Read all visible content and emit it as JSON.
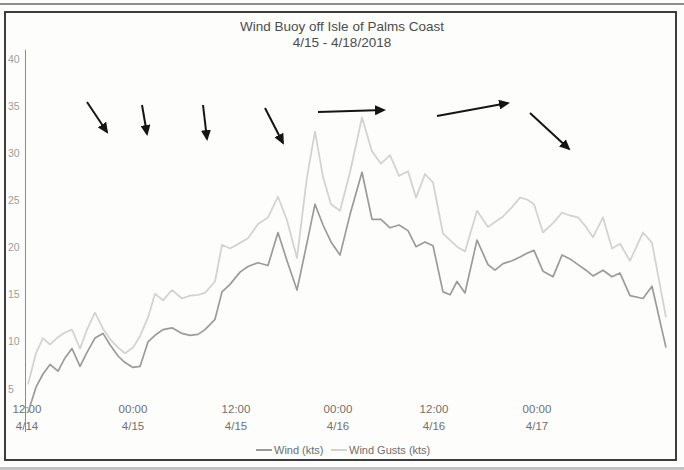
{
  "window": {
    "title_line1": "Wind Buoy off Isle of Palms Coast",
    "title_line2": "4/15 - 4/18/2018"
  },
  "chart_data": {
    "type": "line",
    "title": "Wind Buoy off Isle of Palms Coast",
    "subtitle": "4/15 - 4/18/2018",
    "xlabel": "",
    "ylabel": "",
    "ylim": [
      0,
      40
    ],
    "grid": false,
    "legend_position": "bottom",
    "yticks": [
      40,
      35,
      30,
      25,
      20,
      15,
      10,
      5
    ],
    "x_axis_ticks": [
      {
        "time": "12:00",
        "date": "4/14",
        "x_px": 27
      },
      {
        "time": "00:00",
        "date": "4/15",
        "x_px": 133
      },
      {
        "time": "12:00",
        "date": "4/15",
        "x_px": 236
      },
      {
        "time": "00:00",
        "date": "4/16",
        "x_px": 338
      },
      {
        "time": "12:00",
        "date": "4/16",
        "x_px": 434
      },
      {
        "time": "00:00",
        "date": "4/17",
        "x_px": 537
      }
    ],
    "series": [
      {
        "name": "Wind (kts)",
        "color": "#9b9b9b",
        "x_px": [
          28,
          36,
          43,
          50,
          58,
          65,
          72,
          80,
          87,
          95,
          103,
          110,
          118,
          125,
          133,
          140,
          148,
          155,
          163,
          172,
          182,
          190,
          198,
          205,
          215,
          222,
          230,
          240,
          248,
          258,
          268,
          278,
          287,
          297,
          307,
          315,
          323,
          331,
          340,
          350,
          362,
          372,
          381,
          390,
          399,
          408,
          416,
          425,
          433,
          443,
          450,
          457,
          465,
          477,
          488,
          495,
          503,
          512,
          520,
          527,
          534,
          543,
          553,
          562,
          570,
          578,
          586,
          593,
          603,
          612,
          620,
          630,
          643,
          652,
          666
        ],
        "values": [
          2.5,
          5.2,
          6.6,
          7.6,
          6.9,
          8.3,
          9.3,
          7.4,
          8.9,
          10.4,
          10.9,
          9.7,
          8.5,
          7.8,
          7.3,
          7.4,
          10.0,
          10.7,
          11.3,
          11.5,
          10.9,
          10.7,
          10.8,
          11.3,
          12.4,
          15.3,
          16.1,
          17.4,
          18.0,
          18.4,
          18.1,
          21.6,
          18.6,
          15.5,
          20.5,
          24.6,
          22.4,
          20.6,
          19.2,
          23.5,
          28.0,
          23.0,
          23.0,
          22.1,
          22.4,
          21.8,
          20.1,
          20.6,
          20.2,
          15.3,
          15.0,
          16.4,
          15.2,
          20.8,
          18.2,
          17.6,
          18.3,
          18.6,
          19.0,
          19.4,
          19.7,
          17.5,
          16.9,
          19.2,
          18.8,
          18.2,
          17.6,
          17.0,
          17.6,
          16.9,
          17.3,
          14.9,
          14.6,
          15.9,
          9.4
        ]
      },
      {
        "name": "Wind Gusts (kts)",
        "color": "#d3d3d3",
        "x_px": [
          28,
          36,
          43,
          50,
          58,
          65,
          72,
          80,
          87,
          95,
          103,
          110,
          118,
          125,
          133,
          140,
          148,
          155,
          163,
          172,
          182,
          190,
          198,
          205,
          215,
          222,
          230,
          240,
          248,
          258,
          268,
          278,
          287,
          297,
          307,
          315,
          323,
          331,
          340,
          350,
          362,
          372,
          381,
          390,
          399,
          408,
          416,
          425,
          433,
          443,
          450,
          457,
          465,
          477,
          488,
          495,
          503,
          512,
          520,
          527,
          534,
          543,
          553,
          562,
          570,
          578,
          586,
          593,
          603,
          612,
          620,
          630,
          643,
          652,
          666
        ],
        "values": [
          5.5,
          8.8,
          10.4,
          9.7,
          10.5,
          11.0,
          11.3,
          9.3,
          11.3,
          13.1,
          11.4,
          10.3,
          9.4,
          8.8,
          9.4,
          10.6,
          12.6,
          15.1,
          14.4,
          15.5,
          14.6,
          14.9,
          15.0,
          15.2,
          16.4,
          20.3,
          19.9,
          20.5,
          21.0,
          22.5,
          23.2,
          25.4,
          22.9,
          18.9,
          27.5,
          32.3,
          27.5,
          24.6,
          23.9,
          28.0,
          33.8,
          30.2,
          28.9,
          29.8,
          27.6,
          28.1,
          25.3,
          27.8,
          26.9,
          21.5,
          20.8,
          20.1,
          19.6,
          23.9,
          22.2,
          22.7,
          23.3,
          24.3,
          25.3,
          25.1,
          24.6,
          21.6,
          22.6,
          23.7,
          23.4,
          23.2,
          22.2,
          21.1,
          23.2,
          19.9,
          20.4,
          18.6,
          21.6,
          20.5,
          12.6
        ]
      }
    ],
    "wind_direction_arrows": [
      {
        "x1": 87,
        "y1": 102,
        "x2": 107,
        "y2": 132
      },
      {
        "x1": 142,
        "y1": 105,
        "x2": 147,
        "y2": 134
      },
      {
        "x1": 203,
        "y1": 105,
        "x2": 207,
        "y2": 139
      },
      {
        "x1": 265,
        "y1": 108,
        "x2": 283,
        "y2": 143
      },
      {
        "x1": 318,
        "y1": 112,
        "x2": 384,
        "y2": 110
      },
      {
        "x1": 437,
        "y1": 116,
        "x2": 508,
        "y2": 103
      },
      {
        "x1": 530,
        "y1": 113,
        "x2": 569,
        "y2": 149
      }
    ]
  },
  "legend": {
    "items": [
      {
        "label": "Wind (kts)",
        "color": "#9b9b9b"
      },
      {
        "label": "Wind Gusts (kts)",
        "color": "#d3d3d3"
      }
    ]
  }
}
